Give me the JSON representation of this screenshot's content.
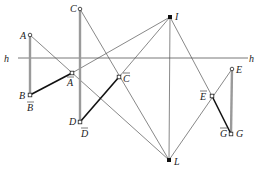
{
  "points": {
    "A": {
      "label": "A",
      "x": 30,
      "y": 35
    },
    "B": {
      "label": "B",
      "x": 30,
      "y": 95
    },
    "Abar": {
      "label": "A",
      "x": 72,
      "y": 73
    },
    "Bbar": {
      "label": "B"
    },
    "C": {
      "label": "C",
      "x": 80,
      "y": 9
    },
    "D": {
      "label": "D",
      "x": 80,
      "y": 122
    },
    "Cbar": {
      "label": "C",
      "x": 119,
      "y": 77
    },
    "Dbar": {
      "label": "D"
    },
    "I": {
      "label": "I",
      "x": 170,
      "y": 17
    },
    "L": {
      "label": "L",
      "x": 169,
      "y": 160
    },
    "E": {
      "label": "E",
      "x": 232,
      "y": 69
    },
    "G": {
      "label": "G",
      "x": 231,
      "y": 134
    },
    "Ebar": {
      "label": "E",
      "x": 212,
      "y": 96
    },
    "Gbar": {
      "label": "G"
    }
  },
  "line_h": {
    "label": "h"
  },
  "colors": {
    "thin": "#555555",
    "thick": "#111111",
    "gray_segment": "#9a9a9a"
  }
}
